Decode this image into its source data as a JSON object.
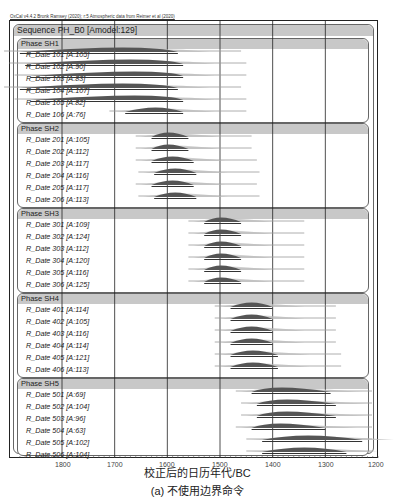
{
  "credit": "OxCal v4.4.2 Bronk Ramsey (2020); r:5 Atmospheric data from Reimer et al (2020)",
  "sequence": {
    "title": "Sequence PH_B0 [Amodel:129]"
  },
  "phases": [
    {
      "title": "Phase SH1",
      "rows": [
        {
          "label": "R_Date 101 [A:105]"
        },
        {
          "label": "R_Date 102 [A:90]"
        },
        {
          "label": "R_Date 103 [A:83]"
        },
        {
          "label": "R_Date 104 [A:107]"
        },
        {
          "label": "R_Date 105 [A:82]"
        },
        {
          "label": "R_Date 106 [A:76]"
        }
      ]
    },
    {
      "title": "Phase SH2",
      "rows": [
        {
          "label": "R_Date 201 [A:105]"
        },
        {
          "label": "R_Date 202 [A:112]"
        },
        {
          "label": "R_Date 203 [A:117]"
        },
        {
          "label": "R_Date 204 [A:116]"
        },
        {
          "label": "R_Date 205 [A:117]"
        },
        {
          "label": "R_Date 206 [A:113]"
        }
      ]
    },
    {
      "title": "Phase SH3",
      "rows": [
        {
          "label": "R_Date 301 [A:109]"
        },
        {
          "label": "R_Date 302 [A:124]"
        },
        {
          "label": "R_Date 303 [A:112]"
        },
        {
          "label": "R_Date 304 [A:120]"
        },
        {
          "label": "R_Date 305 [A:116]"
        },
        {
          "label": "R_Date 306 [A:125]"
        }
      ]
    },
    {
      "title": "Phase SH4",
      "rows": [
        {
          "label": "R_Date 401 [A:114]"
        },
        {
          "label": "R_Date 402 [A:105]"
        },
        {
          "label": "R_Date 403 [A:116]"
        },
        {
          "label": "R_Date 404 [A:114]"
        },
        {
          "label": "R_Date 405 [A:121]"
        },
        {
          "label": "R_Date 406 [A:113]"
        }
      ]
    },
    {
      "title": "Phase SH5",
      "rows": [
        {
          "label": "R_Date 501 [A:69]"
        },
        {
          "label": "R_Date 502 [A:104]"
        },
        {
          "label": "R_Date 503 [A:96]"
        },
        {
          "label": "R_Date 504 [A:63]"
        },
        {
          "label": "R_Date 505 [A:102]"
        },
        {
          "label": "R_Date 506 [A:104]"
        }
      ]
    }
  ],
  "axis": {
    "ticks": [
      "1800",
      "1700",
      "1600",
      "1500",
      "1400",
      "1300",
      "1200"
    ]
  },
  "xtitle": "校正后的日历年代/BC",
  "caption": "(a) 不使用边界命令",
  "chart_data": {
    "type": "range-plot",
    "title": "Sequence PH_B0 [Amodel:129]",
    "xlabel": "校正后的日历年代/BC",
    "caption": "(a) 不使用边界命令",
    "xlim": [
      1900,
      1200
    ],
    "xticks": [
      1800,
      1700,
      1600,
      1500,
      1400,
      1300,
      1200
    ],
    "grid": true,
    "colors": {
      "posterior": "#555555",
      "prior": "#aaaaaa",
      "header": "#c8c8c8"
    },
    "series": [
      {
        "name": "Phase SH1",
        "items": [
          {
            "label": "R_Date 101",
            "agreement": 105,
            "range_95": [
              1880,
              1580
            ],
            "peak": 1640
          },
          {
            "label": "R_Date 102",
            "agreement": 90,
            "range_95": [
              1870,
              1570
            ],
            "peak": 1620
          },
          {
            "label": "R_Date 103",
            "agreement": 83,
            "range_95": [
              1860,
              1570
            ],
            "peak": 1610
          },
          {
            "label": "R_Date 104",
            "agreement": 107,
            "range_95": [
              1880,
              1580
            ],
            "peak": 1640
          },
          {
            "label": "R_Date 105",
            "agreement": 82,
            "range_95": [
              1860,
              1570
            ],
            "peak": 1610
          },
          {
            "label": "R_Date 106",
            "agreement": 76,
            "range_95": [
              1680,
              1570
            ],
            "peak": 1620
          }
        ]
      },
      {
        "name": "Phase SH2",
        "items": [
          {
            "label": "R_Date 201",
            "agreement": 105,
            "range_95": [
              1630,
              1560
            ],
            "peak": 1600
          },
          {
            "label": "R_Date 202",
            "agreement": 112,
            "range_95": [
              1630,
              1560
            ],
            "peak": 1600
          },
          {
            "label": "R_Date 203",
            "agreement": 117,
            "range_95": [
              1630,
              1550
            ],
            "peak": 1590
          },
          {
            "label": "R_Date 204",
            "agreement": 116,
            "range_95": [
              1625,
              1545
            ],
            "peak": 1585
          },
          {
            "label": "R_Date 205",
            "agreement": 117,
            "range_95": [
              1630,
              1550
            ],
            "peak": 1590
          },
          {
            "label": "R_Date 206",
            "agreement": 113,
            "range_95": [
              1625,
              1545
            ],
            "peak": 1585
          }
        ]
      },
      {
        "name": "Phase SH3",
        "items": [
          {
            "label": "R_Date 301",
            "agreement": 109,
            "range_95": [
              1530,
              1460
            ],
            "peak": 1500
          },
          {
            "label": "R_Date 302",
            "agreement": 124,
            "range_95": [
              1530,
              1460
            ],
            "peak": 1500
          },
          {
            "label": "R_Date 303",
            "agreement": 112,
            "range_95": [
              1530,
              1460
            ],
            "peak": 1500
          },
          {
            "label": "R_Date 304",
            "agreement": 120,
            "range_95": [
              1530,
              1460
            ],
            "peak": 1500
          },
          {
            "label": "R_Date 305",
            "agreement": 116,
            "range_95": [
              1530,
              1460
            ],
            "peak": 1500
          },
          {
            "label": "R_Date 306",
            "agreement": 125,
            "range_95": [
              1530,
              1460
            ],
            "peak": 1500
          }
        ]
      },
      {
        "name": "Phase SH4",
        "items": [
          {
            "label": "R_Date 401",
            "agreement": 114,
            "range_95": [
              1480,
              1400
            ],
            "peak": 1440
          },
          {
            "label": "R_Date 402",
            "agreement": 105,
            "range_95": [
              1480,
              1400
            ],
            "peak": 1440
          },
          {
            "label": "R_Date 403",
            "agreement": 116,
            "range_95": [
              1480,
              1400
            ],
            "peak": 1440
          },
          {
            "label": "R_Date 404",
            "agreement": 114,
            "range_95": [
              1480,
              1400
            ],
            "peak": 1440
          },
          {
            "label": "R_Date 405",
            "agreement": 121,
            "range_95": [
              1480,
              1390
            ],
            "peak": 1440
          },
          {
            "label": "R_Date 406",
            "agreement": 113,
            "range_95": [
              1480,
              1390
            ],
            "peak": 1440
          }
        ]
      },
      {
        "name": "Phase SH5",
        "items": [
          {
            "label": "R_Date 501",
            "agreement": 69,
            "range_95": [
              1440,
              1290
            ],
            "peak": 1400
          },
          {
            "label": "R_Date 502",
            "agreement": 104,
            "range_95": [
              1430,
              1280
            ],
            "peak": 1390
          },
          {
            "label": "R_Date 503",
            "agreement": 96,
            "range_95": [
              1430,
              1280
            ],
            "peak": 1390
          },
          {
            "label": "R_Date 504",
            "agreement": 63,
            "range_95": [
              1440,
              1300
            ],
            "peak": 1400
          },
          {
            "label": "R_Date 505",
            "agreement": 102,
            "range_95": [
              1420,
              1230
            ],
            "peak": 1340
          },
          {
            "label": "R_Date 506",
            "agreement": 104,
            "range_95": [
              1420,
              1260
            ],
            "peak": 1340
          }
        ]
      }
    ]
  }
}
